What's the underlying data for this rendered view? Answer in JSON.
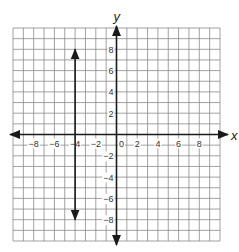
{
  "chart_data": {
    "type": "line",
    "title": "",
    "xlabel": "x",
    "ylabel": "y",
    "xlim": [
      -10,
      10
    ],
    "ylim": [
      -10,
      10
    ],
    "grid": true,
    "grid_step": 1,
    "x_ticks": [
      -8,
      -6,
      -4,
      -2,
      0,
      2,
      4,
      6,
      8
    ],
    "x_tick_labels": [
      "−8",
      "−6",
      "−4",
      "−2",
      "0",
      "2",
      "4",
      "6",
      "8"
    ],
    "y_ticks": [
      8,
      6,
      4,
      2,
      -2,
      -4,
      -6,
      -8
    ],
    "y_tick_labels": [
      "8",
      "6",
      "4",
      "2",
      "−2",
      "−4",
      "−6",
      "−8"
    ],
    "series": [
      {
        "name": "vertical line x = -4",
        "equation": "x = -4",
        "x": [
          -4,
          -4
        ],
        "y": [
          -8,
          8
        ],
        "arrows": "both"
      }
    ],
    "legend": null
  },
  "colors": {
    "grid": "#8a8a8a",
    "axis": "#1a1a1a",
    "line": "#1a1a1a"
  }
}
